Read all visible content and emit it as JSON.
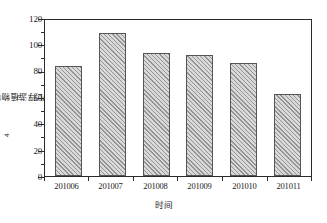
{
  "chart_data": {
    "type": "bar",
    "title": "",
    "categories": [
      "201006",
      "201007",
      "201008",
      "201009",
      "201010",
      "201011"
    ],
    "values": [
      85,
      110,
      95,
      93,
      87,
      63
    ],
    "series": [
      {
        "name": "浮游植物密度",
        "values": [
          85,
          110,
          95,
          93,
          87,
          63
        ]
      }
    ],
    "xlabel": "时间",
    "ylabel": "浮游植物密度（×10⁴ind./L）",
    "ylabel_parts": {
      "prefix": "浮游植物密度（×10",
      "exponent": "4",
      "suffix": "ind./L）"
    },
    "ylim": [
      0,
      120
    ],
    "ytick_labels": [
      "0",
      "20",
      "40",
      "60",
      "80",
      "100",
      "120"
    ],
    "ytick_values": [
      0,
      20,
      40,
      60,
      80,
      100,
      120
    ],
    "y_minor_ticks": [
      10,
      30,
      50,
      70,
      90,
      110
    ],
    "grid": false,
    "legend": null,
    "bar_fill_color": "#d9d9d9",
    "bar_pattern": "diagonal-hatch",
    "bar_edge_color": "#555555",
    "axis_color": "#2b2b2b",
    "background_color": "#ffffff"
  }
}
